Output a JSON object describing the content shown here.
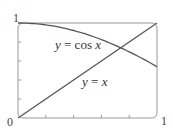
{
  "chart_data": {
    "type": "line",
    "title": "",
    "xlabel": "",
    "ylabel": "",
    "xlim": [
      0,
      1
    ],
    "ylim": [
      0,
      1
    ],
    "grid": false,
    "x_tick_labels": [
      "0",
      "1"
    ],
    "y_tick_labels": [
      "1"
    ],
    "minor_ticks": [
      0.2,
      0.4,
      0.6,
      0.8
    ],
    "series": [
      {
        "name": "y = cos x",
        "x": [
          0,
          0.1,
          0.2,
          0.3,
          0.4,
          0.5,
          0.6,
          0.7,
          0.8,
          0.9,
          1.0
        ],
        "values": [
          1.0,
          0.995,
          0.98,
          0.955,
          0.921,
          0.878,
          0.825,
          0.765,
          0.697,
          0.622,
          0.54
        ]
      },
      {
        "name": "y = x",
        "x": [
          0,
          1
        ],
        "values": [
          0,
          1
        ]
      }
    ],
    "annotations": [
      {
        "text_prefix": "y",
        "text_mid": " = cos ",
        "text_suffix": "x",
        "x": 0.35,
        "y": 0.73
      },
      {
        "text_prefix": "y",
        "text_mid": " = ",
        "text_suffix": "x",
        "x": 0.55,
        "y": 0.32
      }
    ],
    "intersection": {
      "x": 0.739,
      "y": 0.739
    }
  },
  "labels": {
    "origin": "0",
    "x_max": "1",
    "y_max": "1",
    "cos_prefix": "y",
    "cos_mid": " = cos ",
    "cos_suffix": "x",
    "line_prefix": "y",
    "line_mid": " = ",
    "line_suffix": "x"
  }
}
